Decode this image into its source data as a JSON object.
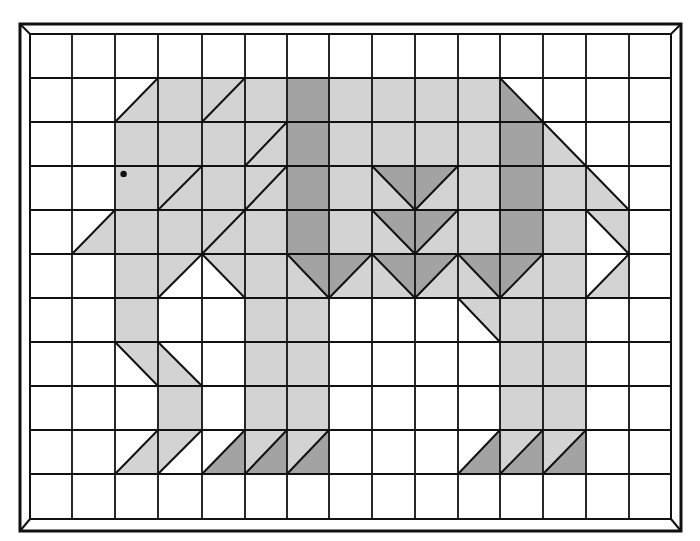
{
  "figure": {
    "grid": {
      "cols": 15,
      "rows": 11
    },
    "colors": {
      "light": "#d3d3d3",
      "dark": "#a3a3a3",
      "line": "#111111",
      "background": "#ffffff"
    },
    "eye": {
      "col": 2,
      "row": 3,
      "dx": 0.2,
      "dy": 0.18
    },
    "cells": [
      {
        "c": 2,
        "r": 1,
        "t": "lr",
        "f": "light"
      },
      {
        "c": 3,
        "r": 1,
        "t": "full",
        "f": "light"
      },
      {
        "c": 4,
        "r": 1,
        "t": "slash",
        "f": "light",
        "f2": "light"
      },
      {
        "c": 5,
        "r": 1,
        "t": "full",
        "f": "light"
      },
      {
        "c": 6,
        "r": 1,
        "t": "full",
        "f": "dark"
      },
      {
        "c": 7,
        "r": 1,
        "t": "full",
        "f": "light"
      },
      {
        "c": 8,
        "r": 1,
        "t": "full",
        "f": "light"
      },
      {
        "c": 9,
        "r": 1,
        "t": "full",
        "f": "light"
      },
      {
        "c": 10,
        "r": 1,
        "t": "full",
        "f": "light"
      },
      {
        "c": 11,
        "r": 1,
        "t": "ll",
        "f": "dark"
      },
      {
        "c": 2,
        "r": 2,
        "t": "full",
        "f": "light"
      },
      {
        "c": 3,
        "r": 2,
        "t": "full",
        "f": "light"
      },
      {
        "c": 4,
        "r": 2,
        "t": "full",
        "f": "light"
      },
      {
        "c": 5,
        "r": 2,
        "t": "slash",
        "f": "light",
        "f2": "light"
      },
      {
        "c": 6,
        "r": 2,
        "t": "full",
        "f": "dark"
      },
      {
        "c": 7,
        "r": 2,
        "t": "full",
        "f": "light"
      },
      {
        "c": 8,
        "r": 2,
        "t": "full",
        "f": "light"
      },
      {
        "c": 9,
        "r": 2,
        "t": "full",
        "f": "light"
      },
      {
        "c": 10,
        "r": 2,
        "t": "full",
        "f": "light"
      },
      {
        "c": 11,
        "r": 2,
        "t": "full",
        "f": "dark"
      },
      {
        "c": 12,
        "r": 2,
        "t": "ll",
        "f": "light"
      },
      {
        "c": 2,
        "r": 3,
        "t": "full",
        "f": "light"
      },
      {
        "c": 3,
        "r": 3,
        "t": "slash",
        "f": "light",
        "f2": "light"
      },
      {
        "c": 4,
        "r": 3,
        "t": "full",
        "f": "light"
      },
      {
        "c": 5,
        "r": 3,
        "t": "slash",
        "f": "light",
        "f2": "light"
      },
      {
        "c": 6,
        "r": 3,
        "t": "full",
        "f": "dark"
      },
      {
        "c": 7,
        "r": 3,
        "t": "full",
        "f": "light"
      },
      {
        "c": 8,
        "r": 3,
        "t": "back",
        "f": "dark",
        "f2": "light"
      },
      {
        "c": 9,
        "r": 3,
        "t": "slash",
        "f": "dark",
        "f2": "light"
      },
      {
        "c": 10,
        "r": 3,
        "t": "full",
        "f": "light"
      },
      {
        "c": 11,
        "r": 3,
        "t": "full",
        "f": "dark"
      },
      {
        "c": 12,
        "r": 3,
        "t": "full",
        "f": "light"
      },
      {
        "c": 13,
        "r": 3,
        "t": "ll",
        "f": "light"
      },
      {
        "c": 1,
        "r": 4,
        "t": "lr",
        "f": "light"
      },
      {
        "c": 2,
        "r": 4,
        "t": "full",
        "f": "light"
      },
      {
        "c": 3,
        "r": 4,
        "t": "full",
        "f": "light"
      },
      {
        "c": 4,
        "r": 4,
        "t": "slash",
        "f": "light",
        "f2": "light"
      },
      {
        "c": 5,
        "r": 4,
        "t": "full",
        "f": "light"
      },
      {
        "c": 6,
        "r": 4,
        "t": "full",
        "f": "dark"
      },
      {
        "c": 7,
        "r": 4,
        "t": "full",
        "f": "light"
      },
      {
        "c": 8,
        "r": 4,
        "t": "back",
        "f": "dark",
        "f2": "light"
      },
      {
        "c": 9,
        "r": 4,
        "t": "slash",
        "f": "dark",
        "f2": "light"
      },
      {
        "c": 10,
        "r": 4,
        "t": "full",
        "f": "light"
      },
      {
        "c": 11,
        "r": 4,
        "t": "full",
        "f": "dark"
      },
      {
        "c": 12,
        "r": 4,
        "t": "full",
        "f": "light"
      },
      {
        "c": 13,
        "r": 4,
        "t": "ur",
        "f": "light"
      },
      {
        "c": 2,
        "r": 5,
        "t": "full",
        "f": "light"
      },
      {
        "c": 3,
        "r": 5,
        "t": "ul",
        "f": "light"
      },
      {
        "c": 4,
        "r": 5,
        "t": "ur",
        "f": "light"
      },
      {
        "c": 5,
        "r": 5,
        "t": "full",
        "f": "light"
      },
      {
        "c": 6,
        "r": 5,
        "t": "back",
        "f": "dark",
        "f2": "light"
      },
      {
        "c": 7,
        "r": 5,
        "t": "slash",
        "f": "dark",
        "f2": "light"
      },
      {
        "c": 8,
        "r": 5,
        "t": "back",
        "f": "dark",
        "f2": "light"
      },
      {
        "c": 9,
        "r": 5,
        "t": "slash",
        "f": "dark",
        "f2": "light"
      },
      {
        "c": 10,
        "r": 5,
        "t": "back",
        "f": "dark",
        "f2": "light"
      },
      {
        "c": 11,
        "r": 5,
        "t": "slash",
        "f": "dark",
        "f2": "light"
      },
      {
        "c": 12,
        "r": 5,
        "t": "full",
        "f": "light"
      },
      {
        "c": 13,
        "r": 5,
        "t": "lr",
        "f": "light"
      },
      {
        "c": 2,
        "r": 6,
        "t": "full",
        "f": "light"
      },
      {
        "c": 5,
        "r": 6,
        "t": "full",
        "f": "light"
      },
      {
        "c": 6,
        "r": 6,
        "t": "full",
        "f": "light"
      },
      {
        "c": 10,
        "r": 6,
        "t": "ur",
        "f": "light"
      },
      {
        "c": 11,
        "r": 6,
        "t": "full",
        "f": "light"
      },
      {
        "c": 12,
        "r": 6,
        "t": "full",
        "f": "light"
      },
      {
        "c": 2,
        "r": 7,
        "t": "ur",
        "f": "light"
      },
      {
        "c": 3,
        "r": 7,
        "t": "ll",
        "f": "light"
      },
      {
        "c": 5,
        "r": 7,
        "t": "full",
        "f": "light"
      },
      {
        "c": 6,
        "r": 7,
        "t": "full",
        "f": "light"
      },
      {
        "c": 11,
        "r": 7,
        "t": "full",
        "f": "light"
      },
      {
        "c": 12,
        "r": 7,
        "t": "full",
        "f": "light"
      },
      {
        "c": 3,
        "r": 8,
        "t": "full",
        "f": "light"
      },
      {
        "c": 5,
        "r": 8,
        "t": "full",
        "f": "light"
      },
      {
        "c": 6,
        "r": 8,
        "t": "full",
        "f": "light"
      },
      {
        "c": 11,
        "r": 8,
        "t": "full",
        "f": "light"
      },
      {
        "c": 12,
        "r": 8,
        "t": "full",
        "f": "light"
      },
      {
        "c": 2,
        "r": 9,
        "t": "lr",
        "f": "light"
      },
      {
        "c": 3,
        "r": 9,
        "t": "ul",
        "f": "light"
      },
      {
        "c": 4,
        "r": 9,
        "t": "lr",
        "f": "dark"
      },
      {
        "c": 5,
        "r": 9,
        "t": "slash",
        "f": "light",
        "f2": "dark"
      },
      {
        "c": 6,
        "r": 9,
        "t": "slash",
        "f": "light",
        "f2": "dark"
      },
      {
        "c": 10,
        "r": 9,
        "t": "lr",
        "f": "dark"
      },
      {
        "c": 11,
        "r": 9,
        "t": "slash",
        "f": "light",
        "f2": "dark"
      },
      {
        "c": 12,
        "r": 9,
        "t": "slash",
        "f": "light",
        "f2": "dark"
      }
    ]
  }
}
